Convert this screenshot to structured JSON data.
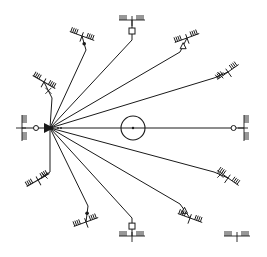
{
  "diagram": {
    "type": "radial-anchor-diagram",
    "background": "#ffffff",
    "stroke_color": "#1a1a1a",
    "hub": {
      "x": 50,
      "y": 128,
      "shape": "filled-triangle"
    },
    "center_circle": {
      "x": 133,
      "y": 128,
      "r": 12,
      "dot": true
    },
    "anchors": [
      {
        "id": "left",
        "end": [
          22,
          128
        ],
        "bend": null,
        "marker": "ring",
        "ground_angle": 90
      },
      {
        "id": "upper-left-1",
        "end": [
          44,
          82
        ],
        "bend": [
          52,
          98
        ],
        "marker": "tick",
        "ground_angle": 30
      },
      {
        "id": "upper-left-2",
        "end": [
          82,
          36
        ],
        "bend": [
          86,
          50
        ],
        "marker": "dot",
        "ground_angle": 20
      },
      {
        "id": "top",
        "end": [
          132,
          20
        ],
        "bend": [
          132,
          40
        ],
        "marker": "square",
        "ground_angle": 0
      },
      {
        "id": "upper-right-1",
        "end": [
          187,
          38
        ],
        "bend": [
          180,
          52
        ],
        "marker": "triangle",
        "ground_angle": -20
      },
      {
        "id": "upper-right-2",
        "end": [
          228,
          72
        ],
        "bend": [
          214,
          78
        ],
        "marker": "tick",
        "ground_angle": -35
      },
      {
        "id": "right",
        "end": [
          244,
          128
        ],
        "bend": [
          225,
          128
        ],
        "marker": "ring",
        "ground_angle": 90
      },
      {
        "id": "lower-right-1",
        "end": [
          228,
          178
        ],
        "bend": [
          214,
          172
        ],
        "marker": "tick",
        "ground_angle": 35
      },
      {
        "id": "lower-right-2",
        "end": [
          190,
          218
        ],
        "bend": [
          180,
          204
        ],
        "marker": "triangle",
        "ground_angle": 20
      },
      {
        "id": "bottom",
        "end": [
          132,
          236
        ],
        "bend": [
          132,
          218
        ],
        "marker": "square",
        "ground_angle": 0
      },
      {
        "id": "lower-left-1",
        "end": [
          86,
          222
        ],
        "bend": [
          88,
          206
        ],
        "marker": "dot",
        "ground_angle": -20
      },
      {
        "id": "lower-left-2",
        "end": [
          38,
          180
        ],
        "bend": [
          50,
          172
        ],
        "marker": "tick",
        "ground_angle": -30
      }
    ],
    "legend_ground_symbol": {
      "x": 237,
      "y": 236
    }
  }
}
